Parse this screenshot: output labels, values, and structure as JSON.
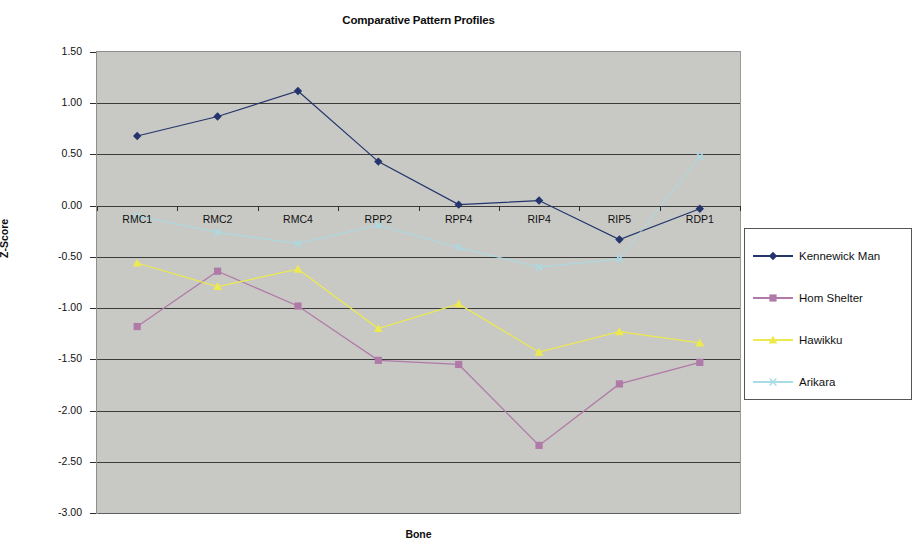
{
  "chart_data": {
    "type": "line",
    "title": "Comparative Pattern Profiles",
    "xlabel": "Bone",
    "ylabel": "Z-Score",
    "grid": true,
    "legend_position": "right",
    "ylim": [
      -3.0,
      1.5
    ],
    "ytick_step": 0.5,
    "ytick_labels": [
      "1.50",
      "1.00",
      "0.50",
      "0.00",
      "-0.50",
      "-1.00",
      "-1.50",
      "-2.00",
      "-2.50",
      "-3.00"
    ],
    "ytick_values": [
      1.5,
      1.0,
      0.5,
      0.0,
      -0.5,
      -1.0,
      -1.5,
      -2.0,
      -2.5,
      -3.0
    ],
    "categories": [
      "RMC1",
      "RMC2",
      "RMC4",
      "RPP2",
      "RPP4",
      "RIP4",
      "RIP5",
      "RDP1"
    ],
    "series": [
      {
        "name": "Kennewick Man",
        "color": "#24356b",
        "marker": "diamond",
        "values": [
          0.68,
          0.87,
          1.12,
          0.43,
          0.01,
          0.05,
          -0.33,
          -0.03
        ]
      },
      {
        "name": "Hom Shelter",
        "color": "#b07aa8",
        "marker": "square",
        "values": [
          -1.18,
          -0.64,
          -0.98,
          -1.51,
          -1.55,
          -2.34,
          -1.74,
          -1.53
        ]
      },
      {
        "name": "Hawikku",
        "color": "#ecea4f",
        "marker": "triangle",
        "values": [
          -0.56,
          -0.79,
          -0.62,
          -1.2,
          -0.96,
          -1.43,
          -1.23,
          -1.34
        ]
      },
      {
        "name": "Arikara",
        "color": "#a8dce6",
        "marker": "x",
        "values": [
          -0.1,
          -0.26,
          -0.37,
          -0.19,
          -0.41,
          -0.6,
          -0.52,
          0.48
        ]
      }
    ]
  },
  "legend": {
    "entries": [
      {
        "label": "Kennewick Man"
      },
      {
        "label": "Hom Shelter"
      },
      {
        "label": "Hawikku"
      },
      {
        "label": "Arikara"
      }
    ]
  }
}
